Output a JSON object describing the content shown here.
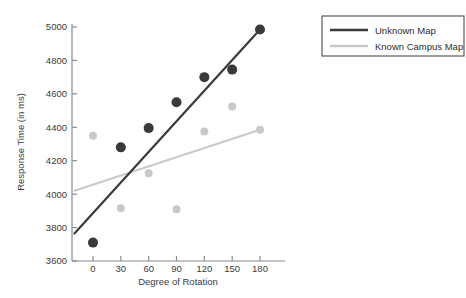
{
  "chart_data": {
    "type": "scatter",
    "title": "",
    "xlabel": "Degree of Rotation",
    "ylabel": "Response Time (in ms)",
    "xlim": [
      -20,
      195
    ],
    "ylim": [
      3600,
      5050
    ],
    "xticks": [
      "0",
      "30",
      "60",
      "90",
      "120",
      "150",
      "180"
    ],
    "xtick_values": [
      0,
      30,
      60,
      90,
      120,
      150,
      180
    ],
    "yticks": [
      "3600",
      "3800",
      "4000",
      "4200",
      "4400",
      "4600",
      "4800",
      "5000"
    ],
    "ytick_values": [
      3600,
      3800,
      4000,
      4200,
      4400,
      4600,
      4800,
      5000
    ],
    "grid": false,
    "legend_position": "top-right",
    "x": [
      0,
      30,
      60,
      90,
      120,
      150,
      180
    ],
    "series": [
      {
        "name": "Unknown Map",
        "color": "#3a3a3a",
        "marker": "circle",
        "marker_size": 5,
        "values": [
          3710,
          4280,
          4395,
          4550,
          4700,
          4745,
          4985
        ],
        "trendline": {
          "x_start": -20,
          "y_start": 3765,
          "x_end": 180,
          "y_end": 4985
        }
      },
      {
        "name": "Known Campus Map",
        "color": "#c9c9c9",
        "marker": "circle",
        "marker_size": 4,
        "values": [
          4350,
          3915,
          4125,
          3910,
          4375,
          4525,
          4385
        ],
        "trendline": {
          "x_start": -20,
          "y_start": 4020,
          "x_end": 180,
          "y_end": 4385
        }
      }
    ]
  },
  "legend": {
    "entries": [
      {
        "label": "Unknown Map",
        "color": "#3a3a3a"
      },
      {
        "label": "Known Campus Map",
        "color": "#c9c9c9"
      }
    ]
  },
  "colors": {
    "axis": "#8a8a8a",
    "text": "#3a3a3a",
    "dark_series": "#3a3a3a",
    "light_series": "#c9c9c9",
    "legend_border": "#5a5a5a",
    "background": "#ffffff"
  }
}
